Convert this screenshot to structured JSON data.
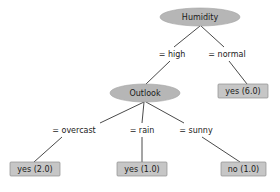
{
  "diagram": {
    "background_color": "#ffffff",
    "node_fill": "#b6b6b6",
    "leaf_fill": "#c6c6c6",
    "edge_color": "#4a4a4a",
    "text_color": "#1a1a1a"
  },
  "nodes": {
    "humidity": {
      "label": "Humidity",
      "type": "decision",
      "cx": 200,
      "cy": 17,
      "rx": 40,
      "ry": 9
    },
    "outlook": {
      "label": "Outlook",
      "type": "decision",
      "cx": 145,
      "cy": 93,
      "rx": 35,
      "ry": 9
    }
  },
  "leaves": {
    "yes6": {
      "label": "yes (6.0)",
      "x": 218,
      "y": 84,
      "w": 50,
      "h": 14
    },
    "yes2": {
      "label": "yes (2.0)",
      "x": 10,
      "y": 162,
      "w": 50,
      "h": 14
    },
    "yes1": {
      "label": "yes (1.0)",
      "x": 117,
      "y": 162,
      "w": 50,
      "h": 14
    },
    "no1": {
      "label": "no (1.0)",
      "x": 221,
      "y": 162,
      "w": 45,
      "h": 14
    }
  },
  "edge_labels": {
    "high": {
      "text": "= high",
      "x": 172,
      "y": 54
    },
    "normal": {
      "text": "= normal",
      "x": 227,
      "y": 54
    },
    "overcast": {
      "text": "= overcast",
      "x": 74,
      "y": 130
    },
    "rain": {
      "text": "= rain",
      "x": 142,
      "y": 130
    },
    "sunny": {
      "text": "= sunny",
      "x": 196,
      "y": 130
    }
  },
  "edges": [
    {
      "name": "humidity-to-high",
      "from": "humidity",
      "to": "high",
      "path": "M 200 26 L 174 47"
    },
    {
      "name": "high-to-outlook",
      "from": "high",
      "to": "outlook",
      "path": "M 170 61 L 146 84"
    },
    {
      "name": "humidity-to-normal",
      "from": "humidity",
      "to": "normal",
      "path": "M 201 26 L 224 47"
    },
    {
      "name": "normal-to-yes6",
      "from": "normal",
      "to": "yes6",
      "path": "M 229 61 L 247 84"
    },
    {
      "name": "outlook-to-overcast",
      "from": "outlook",
      "to": "overcast",
      "path": "M 144 102 L 100 123"
    },
    {
      "name": "overcast-to-yes2",
      "from": "overcast",
      "to": "yes2",
      "path": "M 62 137 L 34 162"
    },
    {
      "name": "outlook-to-rain",
      "from": "outlook",
      "to": "rain",
      "path": "M 144 102 L 142 123"
    },
    {
      "name": "rain-to-yes1",
      "from": "rain",
      "to": "yes1",
      "path": "M 142 137 L 142 162"
    },
    {
      "name": "outlook-to-sunny",
      "from": "outlook",
      "to": "sunny",
      "path": "M 146 102 L 184 123"
    },
    {
      "name": "sunny-to-no1",
      "from": "sunny",
      "to": "no1",
      "path": "M 202 137 L 240 162"
    }
  ]
}
